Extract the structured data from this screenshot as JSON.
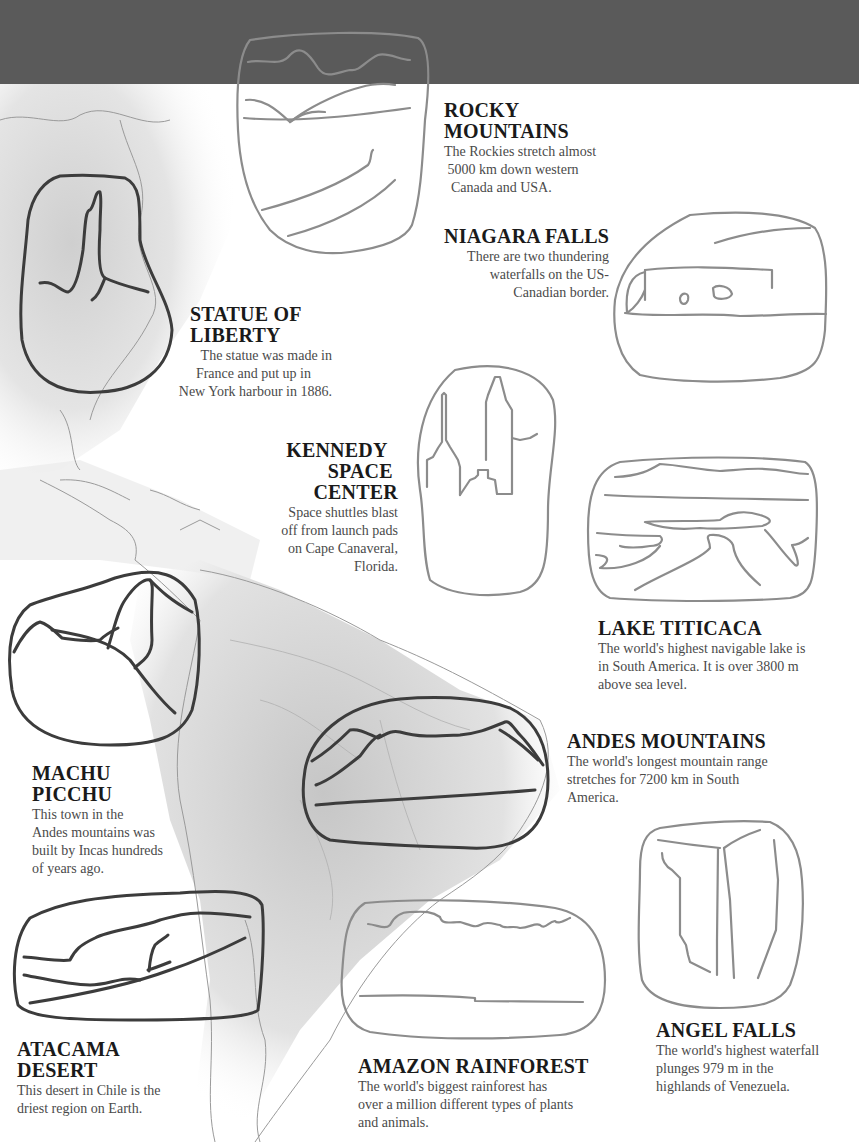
{
  "colors": {
    "header_band": "#5a5a5a",
    "sketch_light": "#8c8c8c",
    "sketch_dark": "#3c3c3c",
    "map_shade": "#d6d6d6",
    "title_text": "#1a1a1a",
    "body_text": "#4a4a4a"
  },
  "landmarks": [
    {
      "id": "rocky-mountains",
      "title_lines": [
        "ROCKY",
        "MOUNTAINS"
      ],
      "text_lines": [
        "The Rockies stretch almost",
        "5000 km down western",
        "Canada and USA."
      ]
    },
    {
      "id": "niagara-falls",
      "title_lines": [
        "NIAGARA FALLS"
      ],
      "text_lines": [
        "There are two thundering",
        "waterfalls on the US-",
        "Canadian border."
      ]
    },
    {
      "id": "statue-of-liberty",
      "title_lines": [
        "STATUE OF",
        "LIBERTY"
      ],
      "text_lines": [
        "The statue was made in",
        "France and put up in",
        "New York harbour in 1886."
      ]
    },
    {
      "id": "kennedy-space-center",
      "title_lines": [
        "KENNEDY",
        "SPACE",
        "CENTER"
      ],
      "text_lines": [
        "Space shuttles blast",
        "off from launch pads",
        "on Cape Canaveral,",
        "Florida."
      ]
    },
    {
      "id": "lake-titicaca",
      "title_lines": [
        "LAKE TITICACA"
      ],
      "text_lines": [
        "The world's highest navigable lake is",
        "in South America. It is over 3800 m",
        "above sea level."
      ]
    },
    {
      "id": "andes-mountains",
      "title_lines": [
        "ANDES MOUNTAINS"
      ],
      "text_lines": [
        "The world's longest mountain range",
        "stretches for 7200 km in South",
        "America."
      ]
    },
    {
      "id": "machu-picchu",
      "title_lines": [
        "MACHU",
        "PICCHU"
      ],
      "text_lines": [
        "This town in the",
        "Andes mountains was",
        "built by Incas hundreds",
        "of years ago."
      ]
    },
    {
      "id": "atacama-desert",
      "title_lines": [
        "ATACAMA",
        "DESERT"
      ],
      "text_lines": [
        "This desert in Chile is the",
        "driest region on Earth."
      ]
    },
    {
      "id": "amazon-rainforest",
      "title_lines": [
        "AMAZON RAINFOREST"
      ],
      "text_lines": [
        "The world's biggest rainforest has",
        "over a million different types of plants",
        "and animals."
      ]
    },
    {
      "id": "angel-falls",
      "title_lines": [
        "ANGEL FALLS"
      ],
      "text_lines": [
        "The world's highest waterfall",
        "plunges 979 m in the",
        "highlands of Venezuela."
      ]
    }
  ]
}
